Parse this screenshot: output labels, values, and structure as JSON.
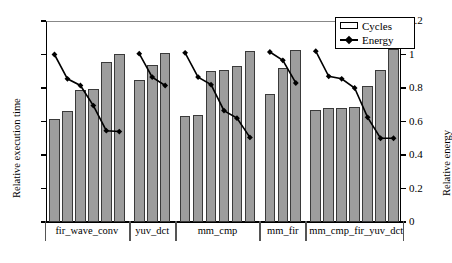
{
  "chart_data": {
    "type": "bar",
    "title": "",
    "xlabel": "",
    "ylabel": "Relative execution time",
    "y2label": "Relative energy",
    "ylim": [
      0,
      1.2
    ],
    "y2lim": [
      0,
      1.2
    ],
    "yticks": [
      "0",
      "0.2",
      "0.4",
      "0.6",
      "0.8",
      "1",
      "1.2"
    ],
    "ytick_values": [
      0,
      0.2,
      0.4,
      0.6,
      0.8,
      1.0,
      1.2
    ],
    "y2ticks": [
      "0",
      "0.2",
      "0.4",
      "0.6",
      "0.8",
      "1",
      "1.2"
    ],
    "y2tick_values": [
      0,
      0.2,
      0.4,
      0.6,
      0.8,
      1.0,
      1.2
    ],
    "grid": false,
    "legend_position": "top-right",
    "legend": [
      {
        "label": "Cycles",
        "kind": "bar"
      },
      {
        "label": "Energy",
        "kind": "line-marker"
      }
    ],
    "categories": [
      "fir_wave_conv",
      "yuv_dct",
      "mm_cmp",
      "mm_fir",
      "mm_cmp_fir_yuv_dct"
    ],
    "groups": [
      {
        "category": "fir_wave_conv",
        "cycles": [
          0.615,
          0.66,
          0.79,
          0.795,
          0.955,
          1.005
        ],
        "energy": [
          1.0,
          0.855,
          0.815,
          0.695,
          0.545,
          0.54
        ]
      },
      {
        "category": "yuv_dct",
        "cycles": [
          0.845,
          0.935,
          1.01
        ],
        "energy": [
          1.005,
          0.865,
          0.815
        ]
      },
      {
        "category": "mm_cmp",
        "cycles": [
          0.63,
          0.64,
          0.9,
          0.91,
          0.93,
          1.02
        ],
        "energy": [
          1.01,
          0.865,
          0.82,
          0.665,
          0.62,
          0.505
        ]
      },
      {
        "category": "mm_fir",
        "cycles": [
          0.765,
          0.92,
          1.025
        ],
        "energy": [
          1.015,
          0.965,
          0.83
        ]
      },
      {
        "category": "mm_cmp_fir_yuv_dct",
        "cycles": [
          0.67,
          0.68,
          0.68,
          0.685,
          0.81,
          0.905,
          1.03
        ],
        "energy": [
          1.02,
          0.87,
          0.855,
          0.8,
          0.625,
          0.5,
          0.5
        ]
      }
    ],
    "colors": {
      "bar_fill": "#9d9d9d",
      "bar_edge": "#3a3a3a",
      "line": "#000000",
      "marker": "#000000",
      "axis": "#000000",
      "background": "#ffffff"
    }
  }
}
